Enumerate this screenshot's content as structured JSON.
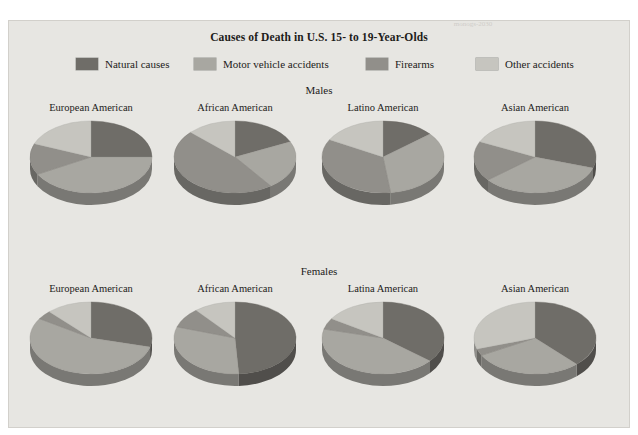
{
  "page": {
    "top_fragment": "monogs-2030",
    "background": "#e7e6e2"
  },
  "chart_data": {
    "type": "pie",
    "title": "Causes of Death in U.S. 15- to 19-Year-Olds",
    "xlabel": "",
    "ylabel": "",
    "legend_position": "top",
    "grid": false,
    "categories": [
      "Natural causes",
      "Motor vehicle accidents",
      "Firearms",
      "Other accidents"
    ],
    "colors": [
      "#6f6d68",
      "#a8a7a1",
      "#918f8a",
      "#c6c5bf"
    ],
    "groups": [
      {
        "label": "Males",
        "charts": [
          {
            "label": "European American",
            "values": [
              25,
              42,
              14,
              19
            ]
          },
          {
            "label": "African American",
            "values": [
              18,
              22,
              47,
              13
            ]
          },
          {
            "label": "Latino American",
            "values": [
              14,
              34,
              35,
              17
            ]
          },
          {
            "label": "Asian American",
            "values": [
              30,
              34,
              18,
              18
            ]
          }
        ]
      },
      {
        "label": "Females",
        "charts": [
          {
            "label": "European American",
            "values": [
              29,
              55,
              4,
              12
            ]
          },
          {
            "label": "African American",
            "values": [
              49,
              31,
              9,
              11
            ]
          },
          {
            "label": "Latina American",
            "values": [
              36,
              43,
              5,
              16
            ]
          },
          {
            "label": "Asian American",
            "values": [
              38,
              29,
              3,
              30
            ]
          }
        ]
      }
    ]
  },
  "legend": {
    "items": [
      {
        "label": "Natural causes",
        "color": "#6f6d68",
        "x": 68
      },
      {
        "label": "Motor vehicle accidents",
        "color": "#a8a7a1",
        "x": 186
      },
      {
        "label": "Firearms",
        "color": "#918f8a",
        "x": 358
      },
      {
        "label": "Other accidents",
        "color": "#c6c5bf",
        "x": 468
      }
    ]
  }
}
